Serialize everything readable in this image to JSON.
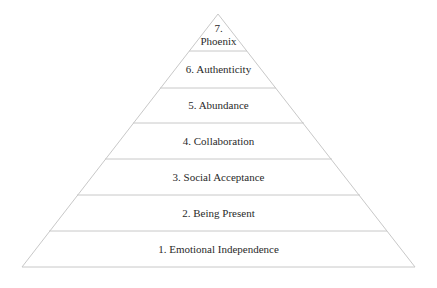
{
  "diagram": {
    "type": "pyramid",
    "line_color": "#c8c8c8",
    "text_color": "#2a2a2a",
    "levels": [
      {
        "number": 7,
        "label": "7.",
        "label2": "Phoenix"
      },
      {
        "number": 6,
        "label": "6. Authenticity"
      },
      {
        "number": 5,
        "label": "5. Abundance"
      },
      {
        "number": 4,
        "label": "4. Collaboration"
      },
      {
        "number": 3,
        "label": "3. Social Acceptance"
      },
      {
        "number": 2,
        "label": "2. Being Present"
      },
      {
        "number": 1,
        "label": "1. Emotional Independence"
      }
    ]
  }
}
